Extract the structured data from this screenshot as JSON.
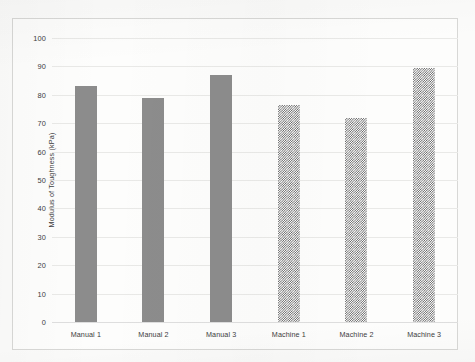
{
  "chart_data": {
    "type": "bar",
    "title": "",
    "subtitle": "",
    "xlabel": "",
    "ylabel": "Modulus of Toughness (kPa)",
    "categories": [
      "Manual 1",
      "Manual 2",
      "Manual 3",
      "Machine 1",
      "Machine 2",
      "Machine 3"
    ],
    "values": [
      83,
      79,
      87,
      76.5,
      72,
      89.5
    ],
    "ylim": [
      0,
      100
    ],
    "ytick_labels": [
      "100",
      "90",
      "80",
      "70",
      "60",
      "50",
      "40",
      "30",
      "20",
      "10",
      "0"
    ],
    "ytick_values": [
      100,
      90,
      80,
      70,
      60,
      50,
      40,
      30,
      20,
      10,
      0
    ],
    "grid": "horizontal",
    "legend": "none",
    "bar_styles": [
      "solid",
      "solid",
      "solid",
      "checkerboard",
      "checkerboard",
      "checkerboard"
    ],
    "colors": {
      "bar_solid": "#8c8c8c",
      "bar_pattern": "#5b5b5b",
      "gridline": "#e9e9e7",
      "frame": "#d8d8d6",
      "text": "#3c3c3c",
      "background": "#fdfdfc"
    }
  }
}
